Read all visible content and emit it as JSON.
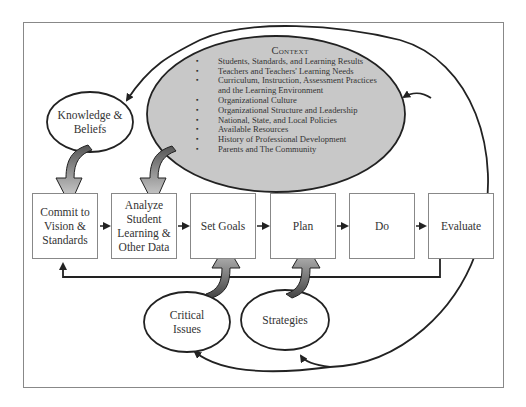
{
  "diagram": {
    "context": {
      "title": "Context",
      "items": [
        "Students, Standards, and Learning Results",
        "Teachers and Teachers' Learning Needs",
        "Curriculum, Instruction, Assessment Practices and the Learning Environment",
        "Organizational Culture",
        "Organizational Structure and Leadership",
        "National, State, and Local Policies",
        "Available Resources",
        "History of Professional Development",
        "Parents and The Community"
      ]
    },
    "ellipses": {
      "knowledge": "Knowledge & Beliefs",
      "critical": "Critical Issues",
      "strategies": "Strategies"
    },
    "steps": [
      {
        "label": "Commit to Vision & Standards"
      },
      {
        "label": "Analyze Student Learning & Other Data"
      },
      {
        "label": "Set Goals"
      },
      {
        "label": "Plan"
      },
      {
        "label": "Do"
      },
      {
        "label": "Evaluate"
      }
    ],
    "colors": {
      "context_fill": "#c8c8c8",
      "stroke": "#222222",
      "frame": "#888888"
    }
  }
}
